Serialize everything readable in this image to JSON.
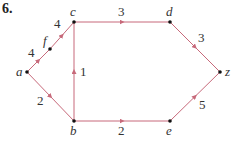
{
  "problem_number": "6.",
  "colors": {
    "edge": "#c7697a",
    "node": "#111111",
    "text": "#333333"
  },
  "nodes": [
    {
      "id": "a",
      "label": "a",
      "x": 27,
      "y": 72
    },
    {
      "id": "f",
      "label": "f",
      "x": 50,
      "y": 49
    },
    {
      "id": "c",
      "label": "c",
      "x": 74,
      "y": 22
    },
    {
      "id": "d",
      "label": "d",
      "x": 170,
      "y": 22
    },
    {
      "id": "z",
      "label": "z",
      "x": 220,
      "y": 72
    },
    {
      "id": "e",
      "label": "e",
      "x": 170,
      "y": 121
    },
    {
      "id": "b",
      "label": "b",
      "x": 74,
      "y": 121
    }
  ],
  "edges": [
    {
      "from": "a",
      "to": "f",
      "weight": "4"
    },
    {
      "from": "f",
      "to": "c",
      "weight": "4"
    },
    {
      "from": "a",
      "to": "b",
      "weight": "2"
    },
    {
      "from": "b",
      "to": "c",
      "weight": "1"
    },
    {
      "from": "c",
      "to": "d",
      "weight": "3"
    },
    {
      "from": "b",
      "to": "e",
      "weight": "2"
    },
    {
      "from": "d",
      "to": "z",
      "weight": "3"
    },
    {
      "from": "e",
      "to": "z",
      "weight": "5"
    }
  ]
}
